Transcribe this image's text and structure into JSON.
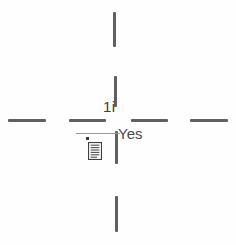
{
  "diagram": {
    "background_color": "#fefefe",
    "stroke_color": "#4a4a4a",
    "leader_color": "#9a9a9a",
    "text_color": "#454545",
    "labels": {
      "center": "1i",
      "answer": "Yes"
    },
    "icons": {
      "document": "document-list-icon",
      "marker": "marker-dot-icon"
    },
    "marks": {
      "dash_left_outer": "dash-segment",
      "dash_left_inner": "dash-segment",
      "dash_right_inner": "dash-segment",
      "dash_right_outer": "dash-segment",
      "dash_top_outer": "dash-segment",
      "dash_top_inner": "dash-segment",
      "dash_bottom_inner": "dash-segment",
      "dash_bottom_outer": "dash-segment",
      "leader": "leader-line"
    }
  }
}
